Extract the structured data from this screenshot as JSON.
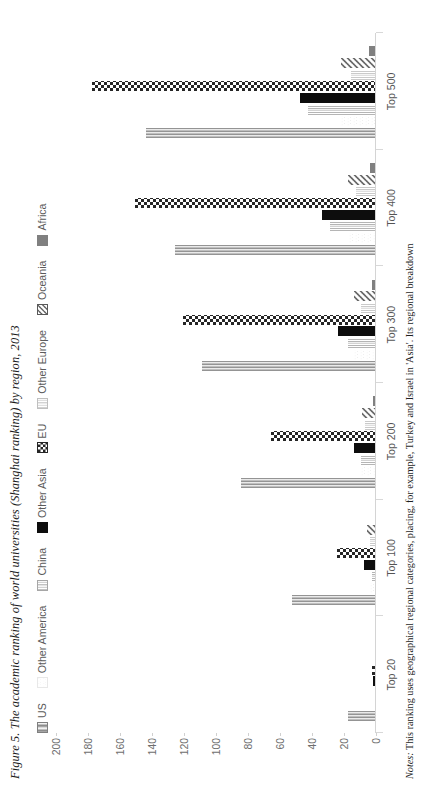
{
  "figure": {
    "title": "Figure 5. The academic ranking of world universities (Shanghai ranking) by region, 2013",
    "note_prefix": "Notes:",
    "note": " This ranking uses geographical regional categories, placing, for example, Turkey and Israel in 'Asia'. Its regional breakdown"
  },
  "chart_data": {
    "type": "bar",
    "title": "The academic ranking of world universities (Shanghai ranking) by region, 2013",
    "xlabel": "",
    "ylabel": "",
    "ylim": [
      0,
      200
    ],
    "yticks": [
      0,
      20,
      40,
      60,
      80,
      100,
      120,
      140,
      160,
      180,
      200
    ],
    "ytick_labels": [
      "0",
      "20",
      "40",
      "60",
      "80",
      "100",
      "120",
      "140",
      "160",
      "180",
      "200"
    ],
    "grid": false,
    "legend_position": "top",
    "categories": [
      "Top 20",
      "Top 100",
      "Top 200",
      "Top 300",
      "Top 400",
      "Top 500"
    ],
    "series": [
      {
        "name": "US",
        "color": "#7f7f7f",
        "pattern": "vlines-dark",
        "values": [
          17,
          52,
          84,
          108,
          125,
          143
        ]
      },
      {
        "name": "Other America",
        "color": "#e8e8e8",
        "pattern": "dots-light",
        "values": [
          0,
          3,
          9,
          13,
          16,
          21
        ]
      },
      {
        "name": "China",
        "color": "#a6a6a6",
        "pattern": "vlines-mid",
        "values": [
          0,
          2,
          9,
          17,
          28,
          42
        ]
      },
      {
        "name": "Other Asia",
        "color": "#0d0d0d",
        "pattern": "solid-dark",
        "values": [
          1,
          7,
          13,
          23,
          33,
          47
        ]
      },
      {
        "name": "EU",
        "color": "#262626",
        "pattern": "checker",
        "values": [
          2,
          24,
          65,
          120,
          150,
          177
        ]
      },
      {
        "name": "Other Europe",
        "color": "#bfbfbf",
        "pattern": "vlines-pale",
        "values": [
          0,
          3,
          6,
          9,
          12,
          15
        ]
      },
      {
        "name": "Oceania",
        "color": "#595959",
        "pattern": "diag-stripes",
        "values": [
          0,
          5,
          8,
          13,
          17,
          21
        ]
      },
      {
        "name": "Africa",
        "color": "#808080",
        "pattern": "solid-grey",
        "values": [
          0,
          0,
          1,
          2,
          3,
          4
        ]
      }
    ]
  }
}
